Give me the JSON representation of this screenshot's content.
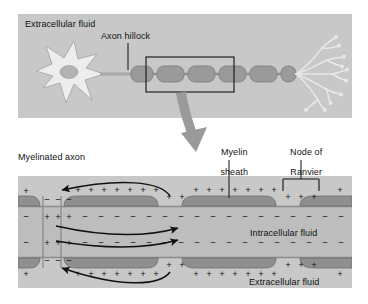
{
  "figure": {
    "title_visible": false,
    "panels": [
      {
        "id": "top-panel",
        "name": "whole-neuron-overview",
        "background_color": "#c8c8c8",
        "labels": {
          "extracellular_fluid": "Extracellular fluid",
          "axon_hillock": "Axon hillock"
        },
        "structures": [
          "soma",
          "nucleus",
          "dendrites",
          "axon-hillock",
          "myelinated-axon",
          "nodes-of-ranvier",
          "axon-terminals"
        ],
        "myelin_segment_count": 6,
        "inset_rectangle": {
          "present": true,
          "segments_enclosed": 3
        }
      },
      {
        "id": "bottom-panel",
        "name": "myelinated-axon-detail",
        "background_color": "#c8c8c8",
        "labels": {
          "myelinated_axon": "Myelinated axon",
          "myelin_sheath": "Myelin\nsheath",
          "myelin_sheath_line1": "Myelin",
          "myelin_sheath_line2": "sheath",
          "node_of_ranvier_line1": "Node of",
          "node_of_ranvier_line2": "Ranvier",
          "intracellular_fluid": "Intracellular fluid",
          "extracellular_fluid": "Extracellular fluid"
        },
        "charges": {
          "outer_top": "+",
          "inner_top": "−",
          "inner_bottom": "−",
          "outer_bottom": "+",
          "depolarized_node_outer": "−",
          "depolarized_node_inner": "+"
        },
        "current_flow": {
          "description": "local current loops jumping between nodes",
          "arrow_count": 4,
          "direction": "saltatory conduction, right to left outside and left to right inside"
        }
      }
    ],
    "connector_arrow": {
      "name": "magnification-arrow",
      "color": "#9a9a9a",
      "from": "inset-rectangle",
      "to": "bottom-panel"
    },
    "colors": {
      "panel_bg": "#c8c8c8",
      "myelin_fill": "#8f8f8f",
      "axoplasm_fill": "#bdbdbd",
      "soma_fill": "#ededed",
      "nucleus_fill": "#b3b3b3",
      "ink": "#111111",
      "arrow_gray": "#9a9a9a"
    }
  }
}
